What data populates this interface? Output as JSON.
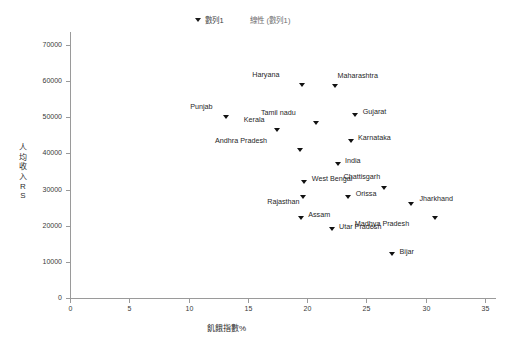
{
  "chart_data": {
    "type": "scatter",
    "title": "",
    "xlabel": "飢餓指數%",
    "ylabel": "人均收入RS",
    "xlim": [
      0,
      35
    ],
    "ylim": [
      0,
      70000
    ],
    "xticks": [
      "0",
      "5",
      "10",
      "15",
      "20",
      "25",
      "30",
      "35"
    ],
    "yticks": [
      "0",
      "10000",
      "20000",
      "30000",
      "40000",
      "50000",
      "60000",
      "70000"
    ],
    "grid": false,
    "legend_position": "top-center",
    "legend": [
      {
        "label": "數列1",
        "marker": "triangle-down",
        "color": "#111111"
      },
      {
        "label": "線性 (數列1)",
        "marker": "line",
        "color": "#6d6d6d"
      }
    ],
    "series": [
      {
        "name": "數列1",
        "points": [
          {
            "label": "Haryana",
            "x": 19.6,
            "y": 59000,
            "label_dx": -23,
            "label_dy": -11
          },
          {
            "label": "Maharashtra",
            "x": 22.4,
            "y": 58500,
            "label_dx": 2,
            "label_dy": -12
          },
          {
            "label": "Punjab",
            "x": 13.2,
            "y": 50000,
            "label_dx": -14,
            "label_dy": -11
          },
          {
            "label": "Gujarat",
            "x": 24.1,
            "y": 50500,
            "label_dx": 7,
            "label_dy": -4
          },
          {
            "label": "Tamil nadu",
            "x": 20.8,
            "y": 48500,
            "label_dx": -21,
            "label_dy": -11
          },
          {
            "label": "Kerala",
            "x": 17.5,
            "y": 46500,
            "label_dx": -13,
            "label_dy": -11
          },
          {
            "label": "Karnataka",
            "x": 23.7,
            "y": 43500,
            "label_dx": 7,
            "label_dy": -4
          },
          {
            "label": "Andhra Pradesh",
            "x": 19.4,
            "y": 40800,
            "label_dx": -33,
            "label_dy": -11
          },
          {
            "label": "India",
            "x": 22.6,
            "y": 37000,
            "label_dx": 7,
            "label_dy": -4
          },
          {
            "label": "West Bengal",
            "x": 19.8,
            "y": 32000,
            "label_dx": 7,
            "label_dy": -4
          },
          {
            "label": "Chattisgarh",
            "x": 26.5,
            "y": 30400,
            "label_dx": -4,
            "label_dy": -12
          },
          {
            "label": "Orissa",
            "x": 23.5,
            "y": 28000,
            "label_dx": 7,
            "label_dy": -4
          },
          {
            "label": "Rajasthan",
            "x": 19.7,
            "y": 28000,
            "label_dx": -4,
            "label_dy": 4
          },
          {
            "label": "Jharkhand",
            "x": 28.8,
            "y": 26000,
            "label_dx": 8,
            "label_dy": -6
          },
          {
            "label": "Assam",
            "x": 19.5,
            "y": 22000,
            "label_dx": 7,
            "label_dy": -4
          },
          {
            "label": "Madhya Pradesh",
            "x": 30.8,
            "y": 22200,
            "label_dx": -26,
            "label_dy": 5
          },
          {
            "label": "Utar Pradesh",
            "x": 22.1,
            "y": 19000,
            "label_dx": 7,
            "label_dy": -3
          },
          {
            "label": "Bijar",
            "x": 27.2,
            "y": 12000,
            "label_dx": 7,
            "label_dy": -4
          }
        ]
      }
    ]
  }
}
